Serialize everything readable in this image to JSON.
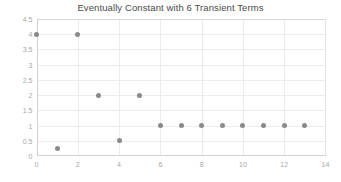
{
  "chart_data": {
    "type": "scatter",
    "title": "Eventually Constant with 6 Transient Terms",
    "xlabel": "",
    "ylabel": "",
    "x": [
      0,
      1,
      2,
      3,
      4,
      5,
      6,
      7,
      8,
      9,
      10,
      11,
      12,
      13
    ],
    "values": [
      4,
      0.25,
      4,
      2,
      0.5,
      2,
      1,
      1,
      1,
      1,
      1,
      1,
      1,
      1
    ],
    "xlim": [
      0,
      14
    ],
    "ylim": [
      0,
      4.5
    ],
    "xticks": [
      0,
      2,
      4,
      6,
      8,
      10,
      12,
      14
    ],
    "xtick_labels": [
      "0",
      "2",
      "4",
      "6",
      "8",
      "10",
      "12",
      "14"
    ],
    "yticks": [
      0,
      0.5,
      1,
      1.5,
      2,
      2.5,
      3,
      3.5,
      4,
      4.5
    ],
    "ytick_labels": [
      "0",
      "0.5",
      "1",
      "1.5",
      "2",
      "2.5",
      "3",
      "3.5",
      "4",
      "4.5"
    ],
    "grid": true,
    "legend": null,
    "marker_color": "#8a8a8a",
    "grid_color": "#ececec",
    "tick_label_color": "#a8a8a8",
    "title_color": "#4a4a4a",
    "background_color": "#ffffff"
  }
}
